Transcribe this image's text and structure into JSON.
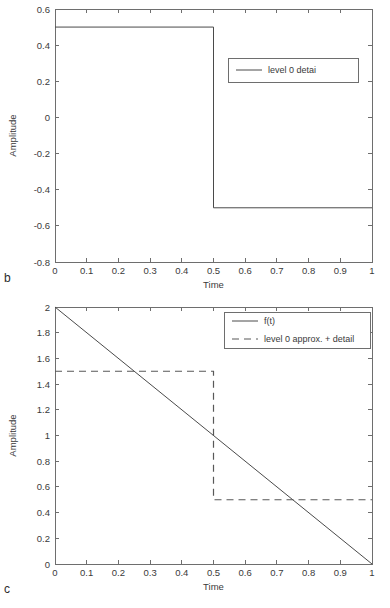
{
  "figure": {
    "background": "#ffffff",
    "line_color": "#4a4a4a",
    "axis_color": "#6e6e6e"
  },
  "panels": [
    {
      "letter": "b",
      "chart_data": {
        "type": "line",
        "title": "",
        "xlabel": "Time",
        "ylabel": "Amplitude",
        "xlim": [
          0,
          1
        ],
        "ylim": [
          -0.8,
          0.6
        ],
        "xticks": [
          "0",
          "0.1",
          "0.2",
          "0.3",
          "0.4",
          "0.5",
          "0.6",
          "0.7",
          "0.8",
          "0.9",
          "1"
        ],
        "xtick_values": [
          0,
          0.1,
          0.2,
          0.3,
          0.4,
          0.5,
          0.6,
          0.7,
          0.8,
          0.9,
          1
        ],
        "yticks": [
          "0.6",
          "0.4",
          "0.2",
          "0",
          "-0.2",
          "-0.4",
          "-0.6",
          "-0.8"
        ],
        "ytick_values": [
          0.6,
          0.4,
          0.2,
          0,
          -0.2,
          -0.4,
          -0.6,
          -0.8
        ],
        "grid": false,
        "legend_position": "upper right",
        "series": [
          {
            "name": "level 0 detai",
            "style": "solid",
            "x": [
              0,
              0.5,
              0.5,
              1
            ],
            "values": [
              0.5,
              0.5,
              -0.5,
              -0.5
            ]
          }
        ]
      }
    },
    {
      "letter": "c",
      "chart_data": {
        "type": "line",
        "title": "",
        "xlabel": "Time",
        "ylabel": "Amplitude",
        "xlim": [
          0,
          1
        ],
        "ylim": [
          0,
          2
        ],
        "xticks": [
          "0",
          "0.1",
          "0.2",
          "0.3",
          "0.4",
          "0.5",
          "0.6",
          "0.7",
          "0.8",
          "0.9",
          "1"
        ],
        "xtick_values": [
          0,
          0.1,
          0.2,
          0.3,
          0.4,
          0.5,
          0.6,
          0.7,
          0.8,
          0.9,
          1
        ],
        "yticks": [
          "2",
          "1.8",
          "1.6",
          "1.4",
          "1.2",
          "1",
          "0.8",
          "0.6",
          "0.4",
          "0.2",
          "0"
        ],
        "ytick_values": [
          2,
          1.8,
          1.6,
          1.4,
          1.2,
          1,
          0.8,
          0.6,
          0.4,
          0.2,
          0
        ],
        "grid": false,
        "legend_position": "upper right",
        "series": [
          {
            "name": "f(t)",
            "style": "solid",
            "x": [
              0,
              1
            ],
            "values": [
              2,
              0
            ]
          },
          {
            "name": "level 0 approx. + detail",
            "style": "dashed",
            "x": [
              0,
              0.5,
              0.5,
              1
            ],
            "values": [
              1.5,
              1.5,
              0.5,
              0.5
            ]
          }
        ]
      }
    }
  ]
}
